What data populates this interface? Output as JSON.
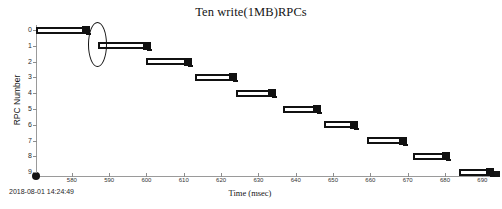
{
  "chart_data": {
    "type": "bar",
    "orientation": "horizontal",
    "title": "Ten write(1MB)RPCs",
    "xlabel": "Time (msec)",
    "ylabel": "RPC Number",
    "xlim": [
      570.4,
      694.2
    ],
    "ylim": [
      0,
      9
    ],
    "grid": false,
    "legend": null,
    "xticks": [
      580,
      590,
      600,
      610,
      620,
      630,
      640,
      650,
      660,
      670,
      680,
      690
    ],
    "xtick_labels": [
      "580",
      "590",
      "600",
      "610",
      "620",
      "630",
      "640",
      "650",
      "660",
      "670",
      "680",
      "690"
    ],
    "yticks": [
      0,
      1,
      2,
      3,
      4,
      5,
      6,
      7,
      8,
      9
    ],
    "ytick_labels": [
      "0",
      "1",
      "2",
      "3",
      "4",
      "5",
      "6",
      "7",
      "8",
      "9"
    ],
    "categories": [
      "0",
      "1",
      "2",
      "3",
      "4",
      "5",
      "6",
      "7",
      "8",
      "9"
    ],
    "bars": [
      {
        "rpc": 0,
        "start": 570.4,
        "end": 584.0,
        "duration": 13.6
      },
      {
        "rpc": 1,
        "start": 587.0,
        "end": 600.4,
        "duration": 13.4
      },
      {
        "rpc": 2,
        "start": 600.0,
        "end": 611.5,
        "duration": 11.5
      },
      {
        "rpc": 3,
        "start": 613.0,
        "end": 623.5,
        "duration": 10.5
      },
      {
        "rpc": 4,
        "start": 624.0,
        "end": 633.8,
        "duration": 9.8
      },
      {
        "rpc": 5,
        "start": 636.6,
        "end": 646.0,
        "duration": 9.4
      },
      {
        "rpc": 6,
        "start": 647.6,
        "end": 656.0,
        "duration": 8.4
      },
      {
        "rpc": 7,
        "start": 659.0,
        "end": 669.0,
        "duration": 10.0
      },
      {
        "rpc": 8,
        "start": 671.5,
        "end": 680.5,
        "duration": 9.0
      },
      {
        "rpc": 9,
        "start": 683.8,
        "end": 692.4,
        "duration": 8.6
      }
    ],
    "annotations": [
      {
        "kind": "ellipse",
        "shape": "oval-highlight",
        "center_x": 586.5,
        "center_y": 0.5,
        "spans_rpcs": [
          0,
          1
        ]
      }
    ],
    "colors": {
      "bar_outline": "#111111",
      "bar_fill": "#ffffff",
      "end_marker": "#111111",
      "axis": "#9a9a9a",
      "text": "#161616"
    }
  },
  "footer": {
    "timestamp": "2018-08-01 14:24:49"
  }
}
